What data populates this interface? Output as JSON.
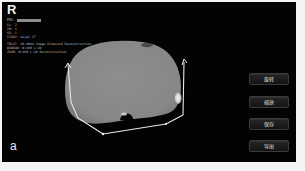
{
  "viewer": {
    "orientation_marker": "R",
    "pid_label": "PID: ",
    "meta_lines": [
      "SL: 2",
      "IM: 3",
      "SE: 1",
      "STUDY: Axial CT"
    ],
    "meta_lines_2": [
      "TRLAT: 60.00mm  Image Enhanced Reconstruction",
      "WINDOW: W:400  L:40",
      "ZOOM: W:400  L:40  Reconstruction"
    ],
    "panel_label": "a",
    "colors": {
      "background": "#030303",
      "tissue": "#8a8a8a",
      "outline": "#e8e8e8",
      "frame": "#f4f4f4"
    }
  },
  "toolbar": {
    "buttons": [
      {
        "label": "旋转",
        "icon": "rotate-icon"
      },
      {
        "label": "缩放",
        "icon": "zoom-icon"
      },
      {
        "label": "保存",
        "icon": "save-icon"
      },
      {
        "label": "导出",
        "icon": "export-icon"
      }
    ]
  }
}
